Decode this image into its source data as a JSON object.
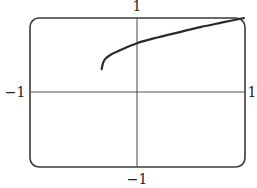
{
  "chart_data": {
    "type": "line",
    "title": "",
    "xlabel": "",
    "ylabel": "",
    "xlim": [
      -1,
      1
    ],
    "ylim": [
      -1,
      1
    ],
    "grid": false,
    "legend": null,
    "tick_labels": {
      "x_left": "−1",
      "x_right": "1",
      "y_top": "1",
      "y_bottom": "−1"
    },
    "series": [
      {
        "name": "curve",
        "x": [
          -0.33,
          -0.32,
          -0.3,
          -0.25,
          -0.15,
          0.0,
          0.2,
          0.4,
          0.6,
          0.8,
          1.0
        ],
        "y": [
          0.31,
          0.38,
          0.44,
          0.5,
          0.57,
          0.66,
          0.74,
          0.81,
          0.88,
          0.94,
          1.0
        ]
      }
    ]
  },
  "labels": {
    "x_left": "−1",
    "x_right": "1",
    "y_top": "1",
    "y_bottom": "−1"
  }
}
